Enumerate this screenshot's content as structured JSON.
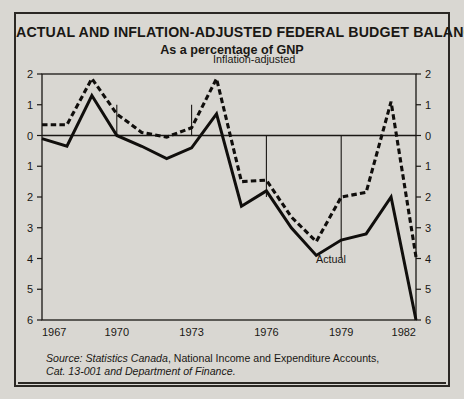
{
  "chart_title": "ACTUAL AND INFLATION-ADJUSTED FEDERAL BUDGET BALANCES",
  "chart_subtitle": "As a percentage of GNP",
  "source": {
    "prefix": "Source: Statistics Canada",
    "line1_rest": ", National Income and Expenditure Accounts,",
    "line2": "Cat. 13-001 and Department of Finance."
  },
  "colors": {
    "background": "#d9d7d2",
    "border": "#2b2824",
    "axis": "#1a1714",
    "series_actual": "#100e0c",
    "series_inflation_adjusted": "#100e0c"
  },
  "chart_data": {
    "type": "line",
    "title": "ACTUAL AND INFLATION-ADJUSTED FEDERAL BUDGET BALANCES",
    "subtitle": "As a percentage of GNP",
    "xlabel": "",
    "ylabel": "As a percentage of GNP",
    "xlim": [
      1967,
      1982
    ],
    "ylim": [
      -6,
      2
    ],
    "y_tick_labels_left": [
      "2",
      "1",
      "0",
      "1",
      "2",
      "3",
      "4",
      "5",
      "6"
    ],
    "y_tick_labels_right": [
      "2",
      "1",
      "0",
      "1",
      "2",
      "3",
      "4",
      "5",
      "6"
    ],
    "y_tick_values": [
      2,
      1,
      0,
      -1,
      -2,
      -3,
      -4,
      -5,
      -6
    ],
    "x_tick_labels": [
      "1967",
      "1970",
      "1973",
      "1976",
      "1979",
      "1982"
    ],
    "x_tick_values": [
      1967,
      1970,
      1973,
      1976,
      1979,
      1982
    ],
    "grid": "partial vertical gridlines at 1970 and 1973 above zero line; at 1976 and 1979 below zero line; horizontal zero line across plot",
    "legend_position": "inline annotations on curves",
    "x": [
      1967,
      1968,
      1969,
      1970,
      1971,
      1972,
      1973,
      1974,
      1975,
      1976,
      1977,
      1978,
      1979,
      1980,
      1981,
      1982
    ],
    "series": [
      {
        "name": "Actual",
        "style": "solid",
        "label_text": "Actual",
        "values": [
          -0.1,
          -0.35,
          1.3,
          0.0,
          -0.35,
          -0.75,
          -0.4,
          0.7,
          -2.3,
          -1.8,
          -3.0,
          -3.9,
          -3.4,
          -3.2,
          -2.0,
          -6.0
        ]
      },
      {
        "name": "Inflation-adjusted",
        "style": "dashed",
        "label_text": "Inflation-adjusted",
        "values": [
          0.35,
          0.35,
          1.85,
          0.7,
          0.1,
          -0.05,
          0.25,
          1.85,
          -1.5,
          -1.45,
          -2.65,
          -3.45,
          -2.0,
          -1.85,
          1.1,
          -3.95
        ]
      }
    ]
  }
}
